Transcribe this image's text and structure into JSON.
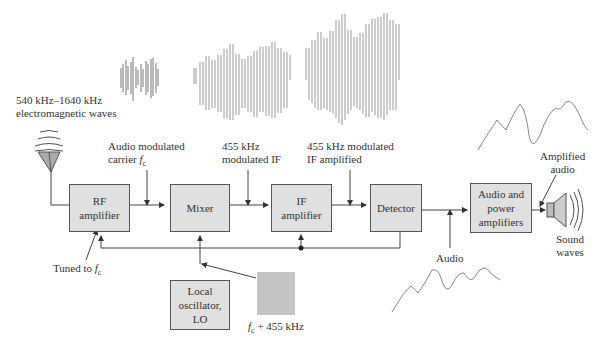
{
  "blocks": {
    "rf": {
      "line1": "RF",
      "line2": "amplifier"
    },
    "mixer": {
      "label": "Mixer"
    },
    "if": {
      "line1": "IF",
      "line2": "amplifier"
    },
    "detector": {
      "label": "Detector"
    },
    "audio": {
      "line1": "Audio and",
      "line2": "power",
      "line3": "amplifiers"
    },
    "lo": {
      "line1": "Local",
      "line2": "oscillator,",
      "line3": "LO"
    }
  },
  "labels": {
    "em_line1": "540 kHz–1640 kHz",
    "em_line2": "electromagnetic waves",
    "carrier_line1": "Audio modulated",
    "carrier_line2": "carrier ",
    "carrier_sym": "f",
    "carrier_sub": "c",
    "if_in_line1": "455 kHz",
    "if_in_line2": "modulated IF",
    "if_out_line1": "455 kHz modulated",
    "if_out_line2": "IF amplified",
    "tuned_text": "Tuned to ",
    "tuned_sym": "f",
    "tuned_sub": "c",
    "lo_freq_sym": "f",
    "lo_freq_sub": "c",
    "lo_freq_text": " + 455 kHz",
    "audio": "Audio",
    "amp_audio_line1": "Amplified",
    "amp_audio_line2": "audio",
    "sound_line1": "Sound",
    "sound_line2": "waves"
  }
}
